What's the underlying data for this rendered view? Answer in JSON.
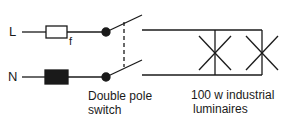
{
  "diagram": {
    "type": "electrical-circuit",
    "stroke_color": "#1a1a1a",
    "background": "#ffffff",
    "terminals": {
      "live": "L",
      "neutral": "N"
    },
    "components": {
      "fuse_label": "f",
      "switch_caption_line1": "Double pole",
      "switch_caption_line2": "switch",
      "luminaire_caption_line1": "100 w industrial",
      "luminaire_caption_line2": "luminaires",
      "luminaire_count": 2
    }
  }
}
